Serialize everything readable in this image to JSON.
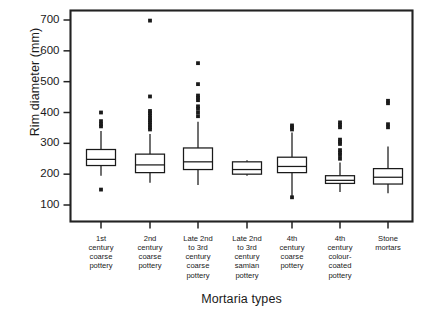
{
  "chart_data": {
    "type": "box",
    "title": "",
    "xlabel": "Mortaria types",
    "ylabel": "Rim diameter (mm)",
    "ylim": [
      90,
      730
    ],
    "yticks": [
      100,
      200,
      300,
      400,
      500,
      600,
      700
    ],
    "grid": false,
    "legend": null,
    "categories": [
      "1st century coarse pottery",
      "2nd century coarse pottery",
      "Late 2nd to 3rd century coarse pottery",
      "Late 2nd to 3rd century samian pottery",
      "4th century coarse pottery",
      "4th century colour-coated pottery",
      "Stone mortars"
    ],
    "category_lines": [
      [
        "1st",
        "century",
        "coarse",
        "pottery"
      ],
      [
        "2nd",
        "century",
        "coarse",
        "pottery"
      ],
      [
        "Late 2nd",
        "to 3rd",
        "century",
        "coarse",
        "pottery"
      ],
      [
        "Late 2nd",
        "to 3rd",
        "century",
        "samian",
        "pottery"
      ],
      [
        "4th",
        "century",
        "coarse",
        "pottery"
      ],
      [
        "4th",
        "century",
        "colour-",
        "coated",
        "pottery"
      ],
      [
        "Stone",
        "mortars"
      ]
    ],
    "boxes": [
      {
        "name": "1st century coarse pottery",
        "whisker_low": 195,
        "q1": 228,
        "median": 248,
        "q3": 280,
        "whisker_high": 340,
        "outliers": [
          150,
          355,
          362,
          372,
          400
        ]
      },
      {
        "name": "2nd century coarse pottery",
        "whisker_low": 172,
        "q1": 205,
        "median": 230,
        "q3": 265,
        "whisker_high": 330,
        "outliers": [
          345,
          352,
          360,
          368,
          375,
          382,
          390,
          398,
          405,
          452,
          698
        ]
      },
      {
        "name": "Late 2nd to 3rd century coarse pottery",
        "whisker_low": 165,
        "q1": 215,
        "median": 240,
        "q3": 285,
        "whisker_high": 370,
        "outliers": [
          388,
          400,
          412,
          420,
          440,
          448,
          455,
          492,
          560
        ]
      },
      {
        "name": "Late 2nd to 3rd century samian pottery",
        "whisker_low": 195,
        "q1": 200,
        "median": 215,
        "q3": 240,
        "whisker_high": 245,
        "outliers": []
      },
      {
        "name": "4th century coarse pottery",
        "whisker_low": 122,
        "q1": 205,
        "median": 225,
        "q3": 255,
        "whisker_high": 335,
        "outliers": [
          125,
          345,
          352,
          358
        ]
      },
      {
        "name": "4th century colour-coated pottery",
        "whisker_low": 142,
        "q1": 170,
        "median": 180,
        "q3": 195,
        "whisker_high": 238,
        "outliers": [
          250,
          262,
          270,
          278,
          298,
          305,
          312,
          352,
          360,
          368
        ]
      },
      {
        "name": "Stone mortars",
        "whisker_low": 138,
        "q1": 168,
        "median": 190,
        "q3": 218,
        "whisker_high": 290,
        "outliers": [
          352,
          362,
          430,
          438
        ]
      }
    ]
  },
  "axis": {
    "ytick_labels": [
      "700",
      "600",
      "500",
      "400",
      "300",
      "200",
      "100"
    ],
    "ylabel_text": "Rim diameter (mm)",
    "xlabel_text": "Mortaria types"
  }
}
